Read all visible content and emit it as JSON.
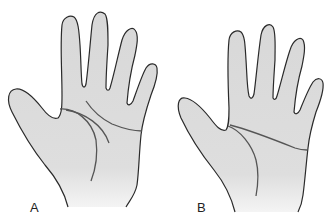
{
  "figure": {
    "panels": [
      {
        "label": "A",
        "description": "hand with normal palmar creases"
      },
      {
        "label": "B",
        "description": "hand with single transverse palmar crease"
      }
    ]
  },
  "colors": {
    "skin_fill": "#dcdcdc",
    "outline": "#2a2a2a",
    "crease": "#555555",
    "background": "#ffffff"
  }
}
